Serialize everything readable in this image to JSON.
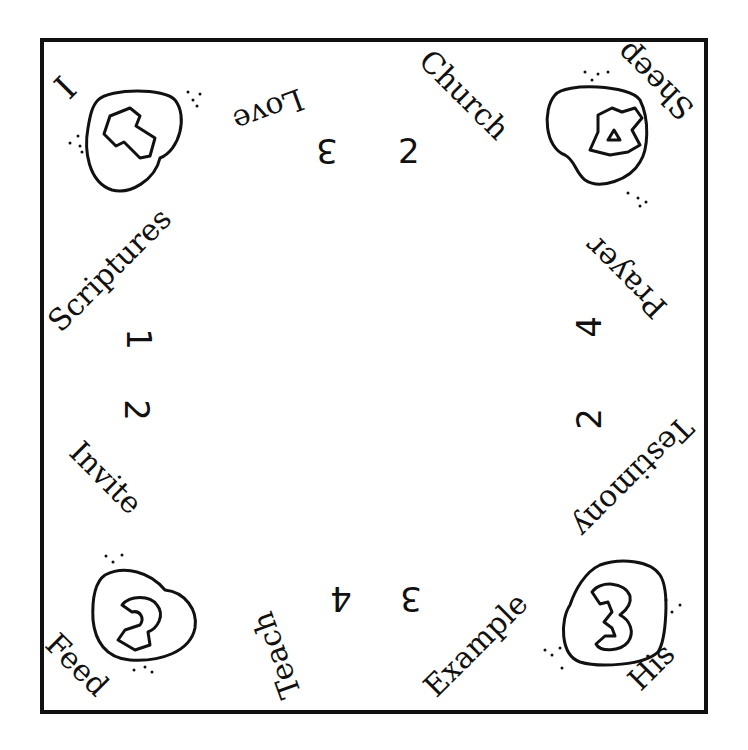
{
  "colors": {
    "ink": "#111111",
    "paper": "#ffffff"
  },
  "corners": {
    "top_left": {
      "word": "I",
      "heart_glyph": "1"
    },
    "top_right": {
      "word": "Sheep",
      "heart_glyph": "4"
    },
    "bottom_left": {
      "word": "Feed",
      "heart_glyph": "2"
    },
    "bottom_right": {
      "word": "His",
      "heart_glyph": "3"
    }
  },
  "flaps": {
    "top": {
      "words": [
        "Love",
        "Church"
      ],
      "numbers": [
        "3",
        "2"
      ]
    },
    "left": {
      "words": [
        "Scriptures",
        "Invite"
      ],
      "numbers": [
        "1",
        "2"
      ]
    },
    "right": {
      "words": [
        "Prayer",
        "Testimony"
      ],
      "numbers": [
        "4",
        "2"
      ]
    },
    "bottom": {
      "words": [
        "Teach",
        "Example"
      ],
      "numbers": [
        "4",
        "3"
      ]
    }
  }
}
